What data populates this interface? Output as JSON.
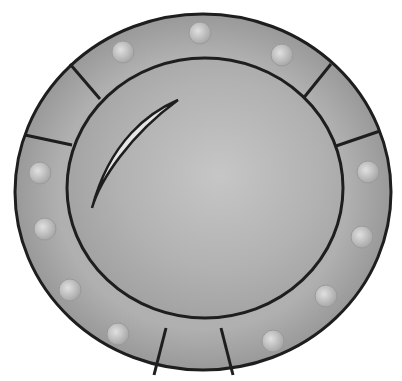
{
  "image": {
    "subject": "round shield",
    "colors": {
      "background": "#ffffff",
      "rim": "#a9a9a9",
      "rim_dark": "#8e8e8e",
      "face": "#b4b4b4",
      "face_light": "#c8c8c8",
      "outline": "#1e1e1e",
      "rivet": "#c9c9c9",
      "highlight": "#e4e4e4"
    },
    "rivets": [
      {
        "cx": 200,
        "cy": 33
      },
      {
        "cx": 123,
        "cy": 52
      },
      {
        "cx": 282,
        "cy": 55
      },
      {
        "cx": 40,
        "cy": 173
      },
      {
        "cx": 368,
        "cy": 172
      },
      {
        "cx": 45,
        "cy": 229
      },
      {
        "cx": 362,
        "cy": 237
      },
      {
        "cx": 70,
        "cy": 290
      },
      {
        "cx": 326,
        "cy": 296
      },
      {
        "cx": 118,
        "cy": 334
      },
      {
        "cx": 273,
        "cy": 341
      }
    ]
  }
}
